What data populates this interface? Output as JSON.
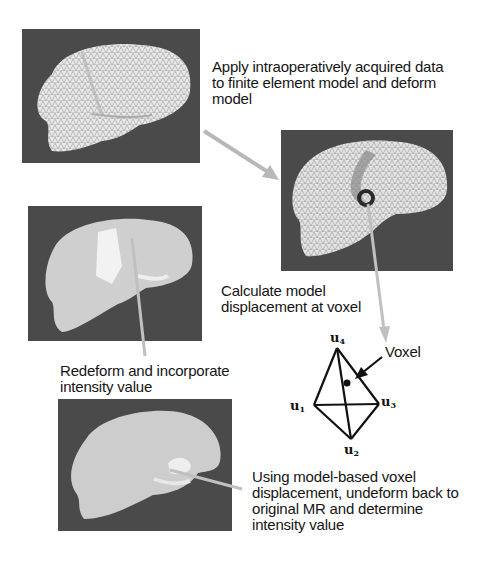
{
  "diagram": {
    "panels": [
      {
        "id": "panel-original-mesh",
        "description": "Undeformed finite element brain mesh"
      },
      {
        "id": "panel-deformed-mesh",
        "description": "Deformed finite element brain mesh with voxel marker"
      },
      {
        "id": "panel-redeformed-render",
        "description": "Redeformed rendered brain volume"
      },
      {
        "id": "panel-original-mr",
        "description": "Original MR brain volume"
      }
    ],
    "captions": {
      "apply": "Apply intraoperatively acquired data to finite element model and deform model",
      "calculate": "Calculate model displacement at voxel",
      "redeform": "Redeform and incorporate intensity value",
      "undeform": "Using model-based voxel displacement, undeform back to original MR and determine intensity value"
    },
    "tetrahedron": {
      "nodes": [
        {
          "name": "u",
          "index": "1"
        },
        {
          "name": "u",
          "index": "2"
        },
        {
          "name": "u",
          "index": "3"
        },
        {
          "name": "u",
          "index": "4"
        }
      ],
      "voxel_label": "Voxel"
    },
    "colors": {
      "arrow": "#b8b8b8",
      "panel_bg": "#4a4a4a",
      "mesh": "#e6e6e6",
      "voxel_marker": "#2a2a2a"
    }
  }
}
